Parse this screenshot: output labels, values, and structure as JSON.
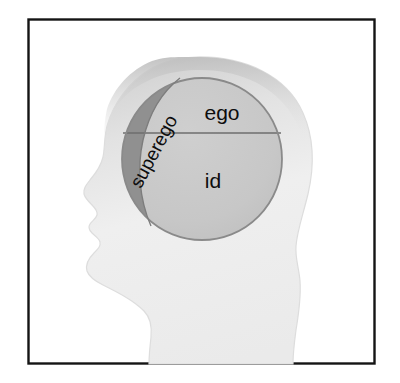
{
  "figure": {
    "frame": {
      "border_color": "#141414",
      "background_color": "#ffffff",
      "x": 28,
      "y": 19,
      "width": 347,
      "height": 345
    },
    "head": {
      "fill_color": "#e9e9e9",
      "shade_color": "#cfcfcf",
      "outline_color": "#d8d8d8",
      "facing": "left"
    },
    "circle": {
      "center_x": 202,
      "center_y": 159,
      "radius_x": 80,
      "radius_y": 81,
      "fill_color": "#c9c9c9",
      "outline_color": "#8a8a8a",
      "divider_y": 133,
      "divider_color": "#6e6e6e"
    },
    "regions": [
      {
        "id": "ego",
        "label": "ego",
        "fill_color": "#c9c9c9",
        "text_color": "#0d0d0d",
        "font_size": 21,
        "rotation_deg": 0,
        "label_x": 222,
        "label_y": 114
      },
      {
        "id": "id",
        "label": "id",
        "fill_color": "#c9c9c9",
        "text_color": "#0d0d0d",
        "font_size": 21,
        "rotation_deg": 0,
        "label_x": 213,
        "label_y": 182
      },
      {
        "id": "superego",
        "label": "superego",
        "fill_color": "#909090",
        "text_color": "#0d0d0d",
        "font_size": 19,
        "rotation_deg": -62,
        "label_x": 155,
        "label_y": 152
      }
    ]
  }
}
